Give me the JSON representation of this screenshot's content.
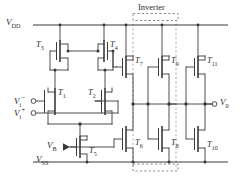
{
  "figure": {
    "kind": "cmos-operational-amplifier-schematic",
    "section_label": "Inverter",
    "ink_color": "#3a3a3a",
    "dash_color": "#9a9a9a",
    "background": "#ffffff"
  },
  "rails": {
    "supply_positive": "V",
    "supply_positive_sub": "DD",
    "supply_negative": "V",
    "supply_negative_sub": "SS"
  },
  "ports": {
    "input_minus_name": "V",
    "input_minus_sub": "i",
    "input_minus_sup": "−",
    "input_plus_name": "V",
    "input_plus_sub": "i",
    "input_plus_sup": "+",
    "bias_name": "V",
    "bias_sub": "B",
    "output_name": "V",
    "output_sub": "0"
  },
  "devices": [
    {
      "id": "T1",
      "label": "T",
      "sub": "1",
      "type": "nmos",
      "role": "diff-pair-input-minus"
    },
    {
      "id": "T2",
      "label": "T",
      "sub": "2",
      "type": "nmos",
      "role": "diff-pair-input-plus"
    },
    {
      "id": "T3",
      "label": "T",
      "sub": "3",
      "type": "pmos",
      "role": "current-mirror-load"
    },
    {
      "id": "T4",
      "label": "T",
      "sub": "4",
      "type": "pmos",
      "role": "current-mirror-load"
    },
    {
      "id": "T5",
      "label": "T",
      "sub": "5",
      "type": "nmos",
      "role": "tail-current-source"
    },
    {
      "id": "T6",
      "label": "T",
      "sub": "6",
      "type": "nmos",
      "role": "gain-stage-pulldown"
    },
    {
      "id": "T7",
      "label": "T",
      "sub": "7",
      "type": "pmos",
      "role": "gain-stage-pullup"
    },
    {
      "id": "T8",
      "label": "T",
      "sub": "8",
      "type": "nmos",
      "role": "inverter-pulldown"
    },
    {
      "id": "T9",
      "label": "T",
      "sub": "9",
      "type": "pmos",
      "role": "inverter-pullup"
    },
    {
      "id": "T10",
      "label": "T",
      "sub": "10",
      "type": "nmos",
      "role": "output-pulldown"
    },
    {
      "id": "T11",
      "label": "T",
      "sub": "11",
      "type": "pmos",
      "role": "output-pullup"
    }
  ]
}
